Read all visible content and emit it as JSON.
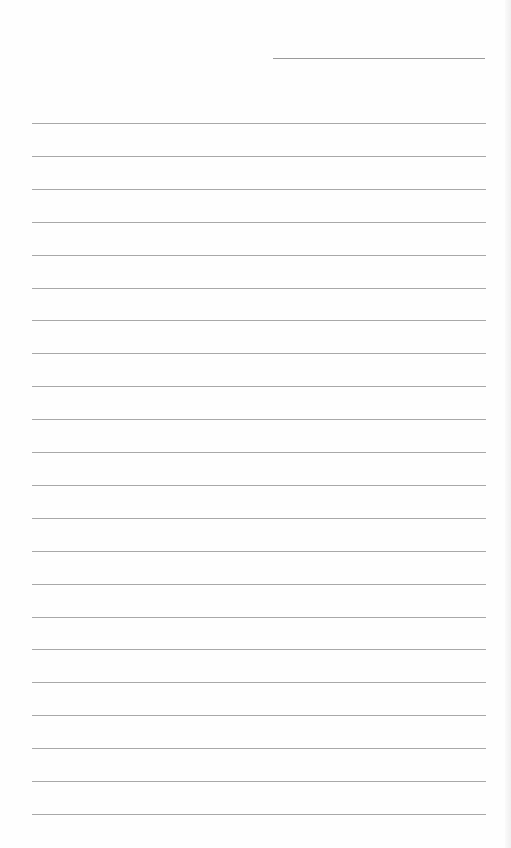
{
  "document": {
    "type": "lined-paper",
    "header_line": {
      "x": 273,
      "y": 58,
      "width": 212
    },
    "rules": {
      "count": 22,
      "start_y": 123,
      "spacing": 32.9,
      "x": 32,
      "width": 454
    },
    "colors": {
      "background": "#fefefe",
      "rule": "#a8a8a8",
      "header_line": "#9a9a9a"
    },
    "text": []
  }
}
